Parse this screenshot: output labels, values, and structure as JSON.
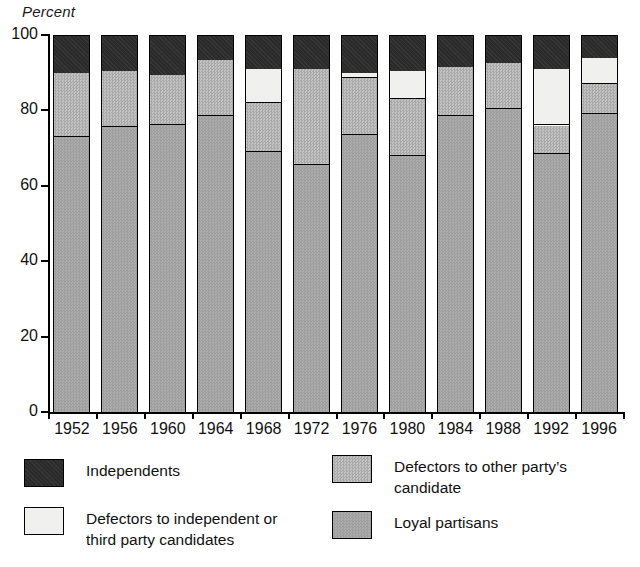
{
  "chart_data": {
    "type": "bar",
    "subtype": "stacked-bar-100",
    "title": "",
    "xlabel": "",
    "ylabel": "Percent",
    "ylim": [
      0,
      100
    ],
    "yticks": [
      0,
      20,
      40,
      60,
      80,
      100
    ],
    "grid": false,
    "legend_position": "bottom",
    "categories": [
      "1952",
      "1956",
      "1960",
      "1964",
      "1968",
      "1972",
      "1976",
      "1980",
      "1984",
      "1988",
      "1992",
      "1996"
    ],
    "series": [
      {
        "name": "Loyal partisans",
        "color": "#a6a6a6",
        "values": [
          73,
          75.5,
          76,
          78.5,
          69,
          65.5,
          73.5,
          68,
          78.5,
          80.5,
          68.5,
          79
        ]
      },
      {
        "name": "Defectors to other party's candidate",
        "color": "#b4b4b4",
        "values": [
          17,
          15,
          13.5,
          15,
          13,
          25.5,
          15,
          15,
          13,
          12,
          7.5,
          8
        ]
      },
      {
        "name": "Defectors to independent or third party candidates",
        "color": "#f0f0ee",
        "values": [
          0,
          0,
          0,
          0,
          9,
          0,
          1.5,
          7.5,
          0,
          0,
          15,
          7
        ]
      },
      {
        "name": "Independents",
        "color": "#2b2b2b",
        "values": [
          10,
          9.5,
          10.5,
          6.5,
          9,
          9,
          10,
          9.5,
          8.5,
          7.5,
          9,
          6
        ]
      }
    ],
    "segment_tops": {
      "1952": {
        "loyal": 73,
        "other": 90,
        "third": 90,
        "independents": 100
      },
      "1956": {
        "loyal": 75.5,
        "other": 90.5,
        "third": 90.5,
        "independents": 100
      },
      "1960": {
        "loyal": 76,
        "other": 89.5,
        "third": 89.5,
        "independents": 100
      },
      "1964": {
        "loyal": 78.5,
        "other": 93.5,
        "third": 93.5,
        "independents": 100
      },
      "1968": {
        "loyal": 69,
        "other": 82,
        "third": 91,
        "independents": 100
      },
      "1972": {
        "loyal": 65.5,
        "other": 91,
        "third": 91,
        "independents": 100
      },
      "1976": {
        "loyal": 73.5,
        "other": 88.5,
        "third": 90,
        "independents": 100
      },
      "1980": {
        "loyal": 68,
        "other": 83,
        "third": 90.5,
        "independents": 100
      },
      "1984": {
        "loyal": 78.5,
        "other": 91.5,
        "third": 91.5,
        "independents": 100
      },
      "1988": {
        "loyal": 80.5,
        "other": 92.5,
        "third": 92.5,
        "independents": 100
      },
      "1992": {
        "loyal": 68.5,
        "other": 76,
        "third": 91,
        "independents": 100
      },
      "1996": {
        "loyal": 79,
        "other": 87,
        "third": 94,
        "independents": 100
      }
    }
  },
  "axis": {
    "y_label": "Percent",
    "y_ticks": [
      "100",
      "80",
      "60",
      "40",
      "20",
      "0"
    ],
    "x_ticks": [
      "1952",
      "1956",
      "1960",
      "1964",
      "1968",
      "1972",
      "1976",
      "1980",
      "1984",
      "1988",
      "1992",
      "1996"
    ]
  },
  "legend": {
    "items": [
      {
        "key": "independents",
        "label": "Independents",
        "color": "#2b2b2b"
      },
      {
        "key": "other",
        "label": "Defectors to other party’s\ncandidate",
        "color": "#b4b4b4"
      },
      {
        "key": "third",
        "label": "Defectors to independent or\nthird party candidates",
        "color": "#f0f0ee"
      },
      {
        "key": "loyal",
        "label": "Loyal partisans",
        "color": "#a6a6a6"
      }
    ]
  }
}
